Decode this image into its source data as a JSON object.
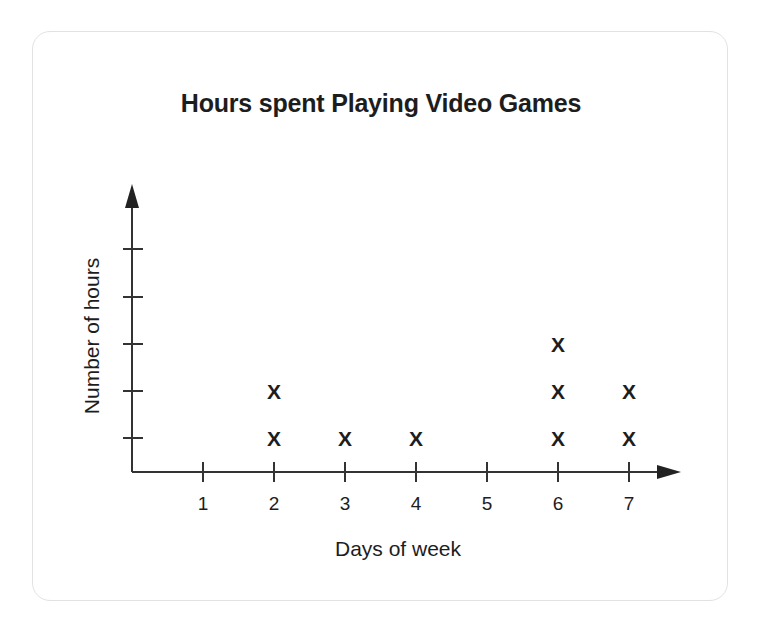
{
  "card": {
    "border_color": "#e2e2e2",
    "background": "#ffffff"
  },
  "chart_data": {
    "type": "scatter",
    "title": "Hours spent Playing Video Games",
    "xlabel": "Days of week",
    "ylabel": "Number of hours",
    "marker": "X",
    "marker_color": "#1d1d1d",
    "axis_color": "#333333",
    "grid": false,
    "legend": null,
    "categories": [
      "1",
      "2",
      "3",
      "4",
      "5",
      "6",
      "7"
    ],
    "x": [
      1,
      2,
      3,
      4,
      5,
      6,
      7
    ],
    "values": [
      0,
      2,
      1,
      1,
      0,
      3,
      2
    ],
    "xlim": [
      0,
      7
    ],
    "ylim": [
      0,
      5
    ],
    "y_tick_count": 5,
    "y_tick_labels": [
      "",
      "",
      "",
      "",
      ""
    ],
    "x_tick_labels": [
      "1",
      "2",
      "3",
      "4",
      "5",
      "6",
      "7"
    ],
    "points": [
      {
        "x": 2,
        "y": 1
      },
      {
        "x": 2,
        "y": 2
      },
      {
        "x": 3,
        "y": 1
      },
      {
        "x": 4,
        "y": 1
      },
      {
        "x": 6,
        "y": 1
      },
      {
        "x": 6,
        "y": 2
      },
      {
        "x": 6,
        "y": 3
      },
      {
        "x": 7,
        "y": 1
      },
      {
        "x": 7,
        "y": 2
      }
    ]
  }
}
